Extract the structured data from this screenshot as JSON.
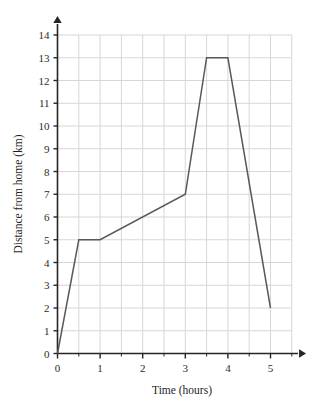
{
  "chart_data": {
    "type": "line",
    "title": "",
    "xlabel": "Time (hours)",
    "ylabel": "Distance from home (km)",
    "xlim": [
      0,
      5.6
    ],
    "ylim": [
      0,
      14.4
    ],
    "grid": true,
    "legend": false,
    "x_ticks": [
      0,
      1,
      2,
      3,
      4,
      5
    ],
    "x_tick_labels": [
      "0",
      "1",
      "2",
      "3",
      "4",
      "5"
    ],
    "x_minor_ticks": [
      0.5,
      1.5,
      2.5,
      3.5,
      4.5,
      5.5
    ],
    "y_ticks": [
      0,
      1,
      2,
      3,
      4,
      5,
      6,
      7,
      8,
      9,
      10,
      11,
      12,
      13,
      14
    ],
    "y_tick_labels": [
      "0",
      "1",
      "2",
      "3",
      "4",
      "5",
      "6",
      "7",
      "8",
      "9",
      "10",
      "11",
      "12",
      "13",
      "14"
    ],
    "series": [
      {
        "name": "Distance from home",
        "color": "#595959",
        "x": [
          0,
          0.5,
          1,
          3,
          3.5,
          4,
          5
        ],
        "y": [
          0,
          5,
          5,
          7,
          13,
          13,
          2
        ],
        "points": [
          {
            "x": 0,
            "y": 0
          },
          {
            "x": 0.5,
            "y": 5
          },
          {
            "x": 1,
            "y": 5
          },
          {
            "x": 3,
            "y": 7
          },
          {
            "x": 3.5,
            "y": 13
          },
          {
            "x": 4,
            "y": 13
          },
          {
            "x": 5,
            "y": 2
          }
        ]
      }
    ],
    "colors": {
      "line": "#595959",
      "grid": "#d6d6dc",
      "axis": "#262626",
      "text": "#1e1e1e",
      "background": "#ffffff"
    }
  },
  "axes": {
    "x_axis_name": "Time (hours)",
    "y_axis_name": "Distance from home (km)",
    "x_arrow": "arrow-right",
    "y_arrow": "arrow-up"
  }
}
